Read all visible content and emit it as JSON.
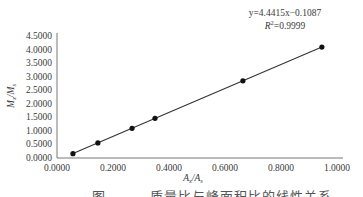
{
  "chart_data": {
    "type": "scatter",
    "title": "",
    "xlabel": "A_x/A_s",
    "ylabel": "M_x/M_s",
    "xlim": [
      0,
      1.0
    ],
    "ylim": [
      0,
      4.5
    ],
    "x_ticks": [
      "0.0000",
      "0.2000",
      "0.4000",
      "0.6000",
      "0.8000",
      "1.0000"
    ],
    "y_ticks": [
      "0.0000",
      "0.5000",
      "1.0000",
      "1.5000",
      "2.0000",
      "2.5000",
      "3.0000",
      "3.5000",
      "4.0000",
      "4.5000"
    ],
    "grid": false,
    "legend": null,
    "series": [
      {
        "name": "data",
        "marker": "circle",
        "line": "linear-fit",
        "x": [
          0.057,
          0.146,
          0.268,
          0.35,
          0.664,
          0.946
        ],
        "y": [
          0.14,
          0.54,
          1.08,
          1.45,
          2.84,
          4.09
        ]
      }
    ],
    "annotations": {
      "equation": "y=4.4415x−0.1087",
      "r_squared": "R²=0.9999"
    },
    "fit": {
      "slope": 4.4415,
      "intercept": -0.1087
    }
  },
  "labels": {
    "xlabel_main": "A",
    "xlabel_sub1": "x",
    "xlabel_sep": "/A",
    "xlabel_sub2": "s",
    "ylabel_main": "M",
    "ylabel_sub1": "x",
    "ylabel_sep": "/M",
    "ylabel_sub2": "s",
    "equation": "y=4.4415x−0.1087",
    "r2_prefix": "R",
    "r2_sup": "2",
    "r2_value": "=0.9999"
  },
  "caption": {
    "figure_label": "图",
    "text": "质量比与峰面积比的线性关系"
  }
}
